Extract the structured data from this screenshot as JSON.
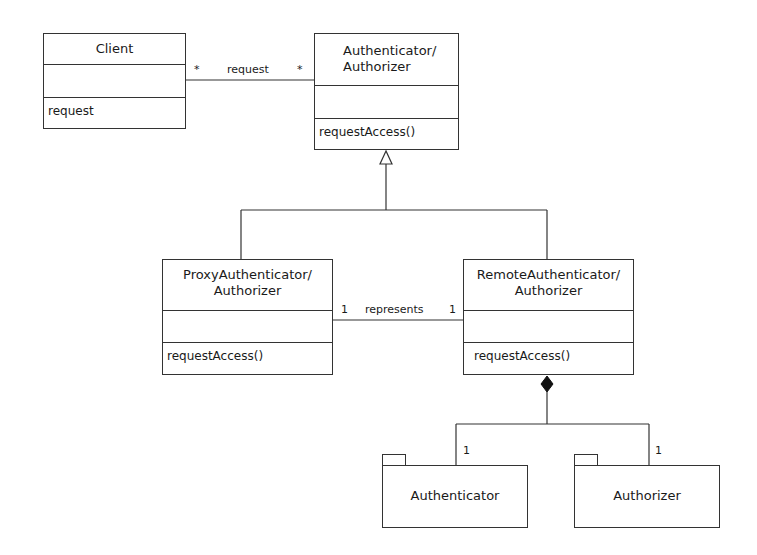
{
  "diagram": {
    "type": "UML class diagram",
    "classes": [
      {
        "name": "Client",
        "attributes": "",
        "operations": [
          "request"
        ]
      },
      {
        "name_line1": "Authenticator/",
        "name_line2": "Authorizer",
        "attributes": "",
        "operations": [
          "requestAccess()"
        ]
      },
      {
        "name_line1": "ProxyAuthenticator/",
        "name_line2": "Authorizer",
        "attributes": "",
        "operations": [
          "requestAccess()"
        ]
      },
      {
        "name_line1": "RemoteAuthenticator/",
        "name_line2": "Authorizer",
        "attributes": "",
        "operations": [
          "requestAccess()"
        ]
      }
    ],
    "packages": [
      {
        "name": "Authenticator"
      },
      {
        "name": "Authorizer"
      }
    ],
    "associations": [
      {
        "label": "request",
        "from_mult": "*",
        "to_mult": "*"
      },
      {
        "label": "represents",
        "from_mult": "1",
        "to_mult": "1"
      }
    ],
    "composition": {
      "left_mult": "1",
      "right_mult": "1"
    }
  }
}
